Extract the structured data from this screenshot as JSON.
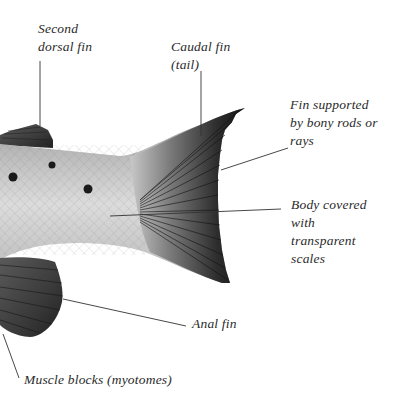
{
  "diagram": {
    "colors": {
      "background": "#ffffff",
      "text": "#2a2a2a",
      "leader_line": "#333333",
      "body_light": "#d8d8d8",
      "body_mid": "#a9a9a9",
      "fin_dark": "#1e1e1e",
      "spot": "#1a1a1a"
    },
    "labels": [
      {
        "id": "second-dorsal-fin",
        "lines": [
          "Second",
          "dorsal fin"
        ]
      },
      {
        "id": "caudal-fin",
        "lines": [
          "Caudal fin",
          "(tail)"
        ]
      },
      {
        "id": "fin-rays",
        "lines": [
          "Fin supported",
          "by bony rods or",
          "rays"
        ]
      },
      {
        "id": "body-scales",
        "lines": [
          "Body covered",
          "with",
          "transparent",
          "scales"
        ]
      },
      {
        "id": "anal-fin",
        "lines": [
          "Anal fin"
        ]
      },
      {
        "id": "muscle-blocks",
        "lines": [
          "Muscle blocks (myotomes)"
        ]
      }
    ]
  }
}
